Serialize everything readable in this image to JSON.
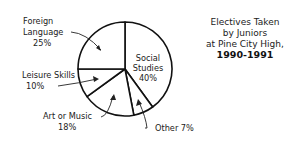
{
  "chart_data": {
    "type": "pie",
    "title_lines": [
      "Electives Taken",
      "by Juniors",
      "at Pine City High,",
      "1990-1991"
    ],
    "categories": [
      "Social Studies",
      "Other",
      "Art or Music",
      "Leisure Skills",
      "Foreign Language"
    ],
    "values": [
      40,
      7,
      18,
      10,
      25
    ],
    "unit": "%",
    "start_angle": "12 o'clock, clockwise",
    "labels": [
      {
        "name_lines": [
          "Social",
          "Studies"
        ],
        "value_text": "40%"
      },
      {
        "name_lines": [
          "Other 7%"
        ],
        "value_text": ""
      },
      {
        "name_lines": [
          "Art or Music"
        ],
        "value_text": "18%"
      },
      {
        "name_lines": [
          "Leisure Skills"
        ],
        "value_text": "10%"
      },
      {
        "name_lines": [
          "Foreign",
          "Language"
        ],
        "value_text": "25%"
      }
    ],
    "legend": "none (callout labels with arrows)"
  }
}
